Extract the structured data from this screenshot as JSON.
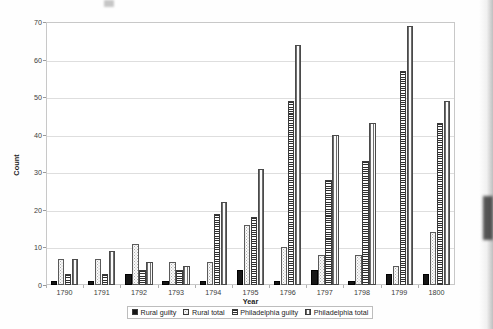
{
  "chart_data": {
    "type": "bar",
    "title": "",
    "xlabel": "Year",
    "ylabel": "Count",
    "ylim": [
      0,
      70
    ],
    "ytick_step": 10,
    "yticks": [
      0,
      10,
      20,
      30,
      40,
      50,
      60,
      70
    ],
    "grid": "horizontal",
    "legend_position": "bottom",
    "categories": [
      "1790",
      "1791",
      "1792",
      "1793",
      "1794",
      "1795",
      "1796",
      "1797",
      "1798",
      "1799",
      "1800"
    ],
    "series": [
      {
        "name": "Rural guilty",
        "fill": "solid-black",
        "color": "#161616",
        "values": [
          1,
          1,
          3,
          1,
          1,
          4,
          1,
          4,
          1,
          3,
          3
        ]
      },
      {
        "name": "Rural total",
        "fill": "dotted-white",
        "color": "#fbfbfb",
        "values": [
          7,
          7,
          11,
          6,
          6,
          16,
          10,
          8,
          8,
          5,
          14
        ]
      },
      {
        "name": "Philadelphia guilty",
        "fill": "horizontal-hatch",
        "color": "#2f2f2f",
        "values": [
          3,
          3,
          4,
          4,
          19,
          18,
          49,
          28,
          33,
          57,
          43
        ]
      },
      {
        "name": "Philadelphia total",
        "fill": "vertical-hatch",
        "color": "#6d6d6d",
        "values": [
          7,
          9,
          6,
          5,
          22,
          31,
          64,
          40,
          43,
          69,
          49
        ]
      }
    ]
  }
}
